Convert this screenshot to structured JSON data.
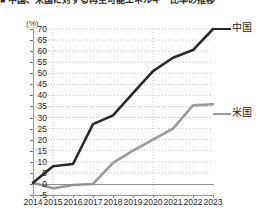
{
  "headline": "■ 中国、米国に対する再生可能エネルギー比率の推移",
  "axis": {
    "unit_label": "(%)",
    "y_ticks": [
      70,
      65,
      60,
      55,
      50,
      45,
      40,
      35,
      30,
      25,
      20,
      15,
      10,
      5,
      0,
      -5
    ],
    "x_ticks": [
      "2014",
      "2015",
      "2016",
      "2017",
      "2018",
      "2019",
      "2020",
      "2021",
      "2022",
      "2023"
    ]
  },
  "legend": {
    "china": "中国",
    "usa": "米国"
  },
  "colors": {
    "china_line": "#2a2a2a",
    "usa_line": "#9a9a9a",
    "grid": "#c8c8c8",
    "axis": "#8f8f8f",
    "text": "#1a1a1a"
  },
  "chart_data": {
    "type": "line",
    "title": "■ 中国、米国に対する再生可能エネルギー比率の推移",
    "xlabel": "",
    "ylabel": "(%)",
    "ylim": [
      -5,
      70
    ],
    "xlim": [
      "2014",
      "2023"
    ],
    "grid": true,
    "legend_position": "right",
    "categories": [
      "2014",
      "2015",
      "2016",
      "2017",
      "2018",
      "2019",
      "2020",
      "2021",
      "2022",
      "2023"
    ],
    "series": [
      {
        "name": "中国",
        "color": "#2a2a2a",
        "values": [
          0.5,
          8,
          9,
          27,
          31,
          41,
          51,
          57,
          60.5,
          70
        ]
      },
      {
        "name": "米国",
        "color": "#9a9a9a",
        "values": [
          0.5,
          -2,
          -0.5,
          0,
          9.5,
          15,
          20,
          25,
          35.5,
          36
        ]
      }
    ]
  }
}
